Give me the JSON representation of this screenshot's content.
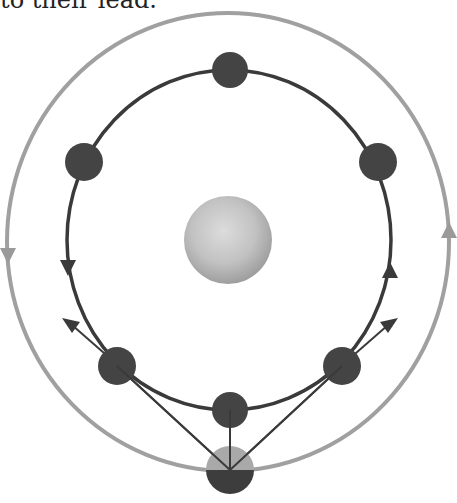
{
  "caption": "to their lead.",
  "diagram": {
    "central_body": {
      "label": "central-body",
      "color": "#b9b9b9"
    },
    "inner_orbit": {
      "color": "#3a3a3a",
      "direction": "counterclockwise",
      "satellites": [
        "top",
        "upper-left",
        "upper-right",
        "lower-left",
        "lower-right",
        "bottom"
      ]
    },
    "outer_orbit": {
      "color": "#9a9a9a",
      "direction": "counterclockwise"
    },
    "bottom_satellite": {
      "top_color": "#a9a9a9",
      "bottom_color": "#3d3d3d"
    },
    "colors": {
      "satellite": "#444444",
      "inner_orbit": "#3a3a3a",
      "outer_orbit": "#a0a0a0",
      "link": "#3a3a3a"
    }
  }
}
